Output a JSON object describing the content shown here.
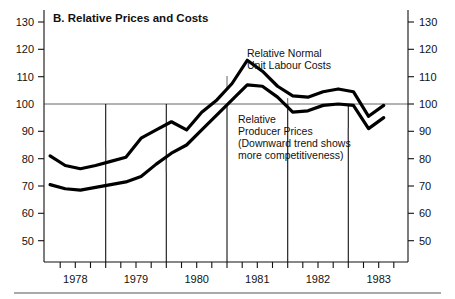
{
  "chart_data": {
    "type": "line",
    "title": "B. Relative Prices and Costs",
    "xlabel": "",
    "ylabel": "",
    "ylim": [
      45,
      135
    ],
    "xlim": [
      1977.5,
      1983.5
    ],
    "grid": false,
    "legend_position": "inline-annotations",
    "reference_line": 100,
    "y_ticks": [
      50,
      60,
      70,
      80,
      90,
      100,
      110,
      120,
      130
    ],
    "y_tick_labels_left": [
      "50",
      "60",
      "70",
      "80",
      "90",
      "100",
      "110",
      "120",
      "130"
    ],
    "y_tick_labels_right": [
      "50",
      "60",
      "70",
      "80",
      "90",
      "100",
      "110",
      "120",
      "130"
    ],
    "x_tick_labels": [
      "1978",
      "1979",
      "1980",
      "1981",
      "1982",
      "1983"
    ],
    "x_minor_ticks_per_year": 4,
    "year_divider_positions": [
      1978.5,
      1979.5,
      1980.5,
      1981.5,
      1982.5
    ],
    "x": [
      1977.6,
      1977.85,
      1978.1,
      1978.35,
      1978.6,
      1978.85,
      1979.1,
      1979.35,
      1979.6,
      1979.85,
      1980.1,
      1980.35,
      1980.6,
      1980.85,
      1981.1,
      1981.35,
      1981.6,
      1981.85,
      1982.1,
      1982.35,
      1982.6,
      1982.85,
      1983.1
    ],
    "series": [
      {
        "name": "Relative Normal Unit Labour Costs",
        "values": [
          81.0,
          77.5,
          76.3,
          77.5,
          79.0,
          80.5,
          87.5,
          90.5,
          93.5,
          90.5,
          97.0,
          101.5,
          107.5,
          116.0,
          112.0,
          106.5,
          103.0,
          102.5,
          104.5,
          105.5,
          104.5,
          95.5,
          99.5
        ]
      },
      {
        "name": "Relative Producer Prices",
        "values": [
          70.5,
          69.0,
          68.5,
          69.5,
          70.5,
          71.5,
          73.5,
          78.0,
          82.0,
          85.0,
          90.5,
          96.0,
          101.5,
          107.0,
          106.5,
          102.5,
          97.0,
          97.5,
          99.5,
          100.0,
          99.5,
          91.0,
          95.0
        ]
      }
    ],
    "annotations": [
      {
        "name": "relative-normal-unit-labour-costs-label",
        "lines": [
          "Relative Normal",
          "Unit Labour Costs"
        ]
      },
      {
        "name": "relative-producer-prices-label",
        "lines": [
          "Relative",
          "Producer Prices",
          "(Downward trend shows",
          "more competitiveness)"
        ]
      }
    ],
    "colors": {
      "line": "#000000",
      "axis": "#111111",
      "reference": "#555555",
      "background": "#ffffff"
    }
  }
}
